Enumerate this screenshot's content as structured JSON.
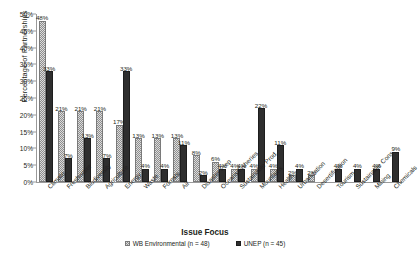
{
  "chart_data": {
    "type": "bar",
    "title": "",
    "xlabel": "Issue Focus",
    "ylabel": "Percentage of Partnerships",
    "ylim": [
      0,
      50
    ],
    "ytick_labels": [
      "0%",
      "5%",
      "10%",
      "15%",
      "20%",
      "25%",
      "30%",
      "35%",
      "40%",
      "45%",
      "50%"
    ],
    "ytick_values": [
      0,
      5,
      10,
      15,
      20,
      25,
      30,
      35,
      40,
      45,
      50
    ],
    "grid": false,
    "legend_position": "bottom",
    "value_label_suffix": "%",
    "categories": [
      "Climate",
      "Freshwater",
      "Biodiversity",
      "Agriculture",
      "Energy",
      "Waste",
      "Forests",
      "Air",
      "Disaster Prep",
      "Oceans/Fisheries",
      "Sustainable Prod.",
      "Mountains",
      "Health",
      "Urbanization",
      "Desertification",
      "Tourism",
      "Sustainable Cons.",
      "Mining",
      "Chemicals"
    ],
    "series": [
      {
        "name": "WB Environmental (n = 48)",
        "color": "#dcdcdc",
        "pattern": "checkered",
        "values": [
          48,
          21,
          21,
          21,
          17,
          13,
          13,
          13,
          8,
          6,
          4,
          4,
          4,
          2,
          2,
          null,
          null,
          null,
          null
        ],
        "labels": [
          "48%",
          "21%",
          "21%",
          "21%",
          "17%",
          "13%",
          "13%",
          "13%",
          "8%",
          "6%",
          "4%",
          "4%",
          "4%",
          "2%",
          "2%",
          "",
          "",
          "",
          ""
        ]
      },
      {
        "name": "UNEP (n = 45)",
        "color": "#2e2e2e",
        "pattern": "solid",
        "values": [
          33,
          7,
          13,
          7,
          33,
          4,
          4,
          11,
          2,
          4,
          4,
          22,
          11,
          4,
          null,
          4,
          4,
          4,
          9
        ],
        "labels": [
          "33%",
          "7%",
          "13%",
          "7%",
          "33%",
          "4%",
          "4%",
          "11%",
          "2%",
          "4%",
          "4%",
          "22%",
          "11%",
          "4%",
          "",
          "4%",
          "4%",
          "4%",
          "9%"
        ]
      }
    ]
  },
  "legend": {
    "items": [
      {
        "label": "WB Environmental (n = 48)"
      },
      {
        "label": "UNEP (n = 45)"
      }
    ]
  }
}
